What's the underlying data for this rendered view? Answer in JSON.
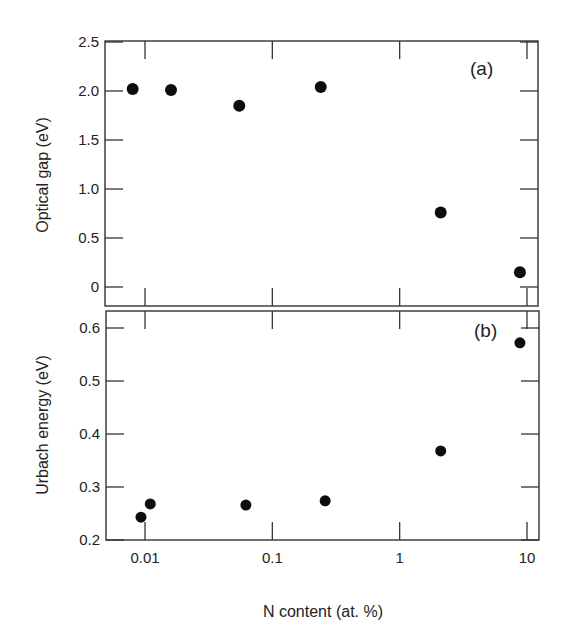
{
  "chart_data": [
    {
      "type": "scatter",
      "panel_label": "(a)",
      "title": "",
      "xlabel": "N content (at. %)",
      "ylabel": "Optical gap (eV)",
      "xscale": "log",
      "xlim": [
        0.0055,
        12
      ],
      "ylim": [
        -0.2,
        2.5
      ],
      "xticks": [
        0.01,
        0.1,
        1,
        10
      ],
      "xtick_labels": [
        "0.01",
        "0.1",
        "1",
        "10"
      ],
      "yticks": [
        0,
        0.5,
        1.0,
        1.5,
        2.0,
        2.5
      ],
      "ytick_labels": [
        "0",
        "0.5",
        "1.0",
        "1.5",
        "2.0",
        "2.5"
      ],
      "grid": false,
      "legend": null,
      "series": [
        {
          "name": "Optical gap",
          "marker": "filled-circle",
          "color": "#0d0d0d",
          "x": [
            0.008,
            0.016,
            0.055,
            0.24,
            2.1,
            8.8
          ],
          "y": [
            2.02,
            2.01,
            1.85,
            2.04,
            0.76,
            0.15
          ]
        }
      ]
    },
    {
      "type": "scatter",
      "panel_label": "(b)",
      "title": "",
      "xlabel": "N content (at. %)",
      "ylabel": "Urbach energy (eV)",
      "xscale": "log",
      "xlim": [
        0.0055,
        12
      ],
      "ylim": [
        0.2,
        0.63
      ],
      "xticks": [
        0.01,
        0.1,
        1,
        10
      ],
      "xtick_labels": [
        "0.01",
        "0.1",
        "1",
        "10"
      ],
      "yticks": [
        0.2,
        0.3,
        0.4,
        0.5,
        0.6
      ],
      "ytick_labels": [
        "0.2",
        "0.3",
        "0.4",
        "0.5",
        "0.6"
      ],
      "grid": false,
      "legend": null,
      "series": [
        {
          "name": "Urbach energy",
          "marker": "filled-circle",
          "color": "#0d0d0d",
          "x": [
            0.0093,
            0.011,
            0.062,
            0.26,
            2.1,
            8.8
          ],
          "y": [
            0.243,
            0.268,
            0.266,
            0.274,
            0.368,
            0.572
          ]
        }
      ]
    }
  ],
  "labels": {
    "panel_a": "(a)",
    "panel_b": "(b)",
    "ylabel_a": "Optical gap (eV)",
    "ylabel_b": "Urbach energy (eV)",
    "xlabel": "N content (at. %)",
    "xticks": [
      "0.01",
      "0.1",
      "1",
      "10"
    ],
    "yticks_a": [
      "0",
      "0.5",
      "1.0",
      "1.5",
      "2.0",
      "2.5"
    ],
    "yticks_b": [
      "0.2",
      "0.3",
      "0.4",
      "0.5",
      "0.6"
    ]
  }
}
